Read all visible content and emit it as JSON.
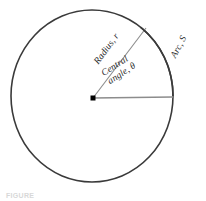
{
  "figure": {
    "type": "geometry-diagram",
    "caption": "FIGURE",
    "background_color": "#ffffff"
  },
  "diagram": {
    "circle": {
      "name": "circle-outline",
      "center_x": 92,
      "center_y": 96,
      "radius_x": 81,
      "radius_y": 86,
      "stroke_color": "#3a3a3a",
      "stroke_width": 1.6,
      "fill": "none"
    },
    "center_point": {
      "name": "center-point",
      "x": 93,
      "y": 98,
      "size": 5,
      "color": "#000000"
    },
    "horizontal_radius": {
      "name": "horizontal-radius-line",
      "x1": 93,
      "y1": 98,
      "x2": 173,
      "y2": 97,
      "stroke_color": "#8c8c8c",
      "stroke_width": 1.6
    },
    "diagonal_radius": {
      "name": "diagonal-radius-line",
      "x1": 93,
      "y1": 98,
      "x2": 146,
      "y2": 28,
      "stroke_color": "#8c8c8c",
      "stroke_width": 1.1
    },
    "arc_highlight": {
      "name": "arc-segment",
      "start_angle_deg": -53,
      "end_angle_deg": 0,
      "stroke_color": "#3a3a3a",
      "stroke_width": 1.6
    }
  },
  "labels": {
    "radius": "Radius, r",
    "central_angle_line1": "Central",
    "central_angle_line2": "angle, θ",
    "arc": "Arc, S"
  }
}
